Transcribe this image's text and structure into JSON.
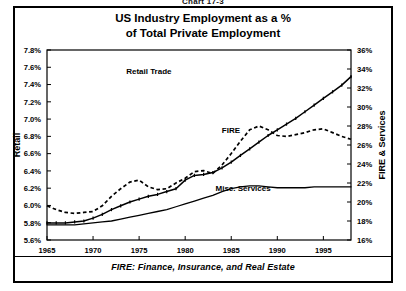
{
  "figure": {
    "number_label": "Chart 17-3",
    "title_line1": "US Industry Employment as a %",
    "title_line2": "of Total Private Employment",
    "footnote": "FIRE:  Finance, Insurance, and Real Estate"
  },
  "chart_data": {
    "type": "line",
    "title": "US Industry Employment as a % of Total Private Employment",
    "subtitle": "",
    "xlabel": "",
    "ylabel": "Retail",
    "y2label": "FIRE & Services",
    "xlim": [
      1965,
      1998
    ],
    "ylim": [
      5.6,
      7.8
    ],
    "y2lim": [
      16,
      36
    ],
    "grid": false,
    "legend": "inline-annotations",
    "xticks": [
      1965,
      1970,
      1975,
      1980,
      1985,
      1990,
      1995
    ],
    "xticklabels": [
      "1965",
      "1970",
      "1975",
      "1980",
      "1985",
      "1990",
      "1995"
    ],
    "yticks": [
      5.6,
      5.8,
      6.0,
      6.2,
      6.4,
      6.6,
      6.8,
      7.0,
      7.2,
      7.4,
      7.6,
      7.8
    ],
    "yticklabels": [
      "5.6%",
      "5.8%",
      "6.0%",
      "6.2%",
      "6.4%",
      "6.6%",
      "6.8%",
      "7.0%",
      "7.2%",
      "7.4%",
      "7.6%",
      "7.8%"
    ],
    "y2ticks": [
      16,
      18,
      20,
      22,
      24,
      26,
      28,
      30,
      32,
      34,
      36
    ],
    "y2ticklabels": [
      "16%",
      "18%",
      "20%",
      "22%",
      "24%",
      "26%",
      "28%",
      "30%",
      "32%",
      "34%",
      "36%"
    ],
    "x": [
      1965,
      1966,
      1967,
      1968,
      1969,
      1970,
      1971,
      1972,
      1973,
      1974,
      1975,
      1976,
      1977,
      1978,
      1979,
      1980,
      1981,
      1982,
      1983,
      1984,
      1985,
      1986,
      1987,
      1988,
      1989,
      1990,
      1991,
      1992,
      1993,
      1994,
      1995,
      1996,
      1997,
      1998
    ],
    "series": [
      {
        "name": "Retail Trade",
        "axis": "right",
        "style": "dashed",
        "units": "%",
        "values": [
          19.6,
          19.2,
          18.9,
          18.8,
          18.9,
          19.0,
          19.6,
          20.6,
          21.4,
          22.1,
          22.3,
          21.6,
          21.3,
          21.4,
          22.0,
          22.5,
          23.2,
          23.3,
          23.0,
          23.9,
          25.1,
          26.4,
          27.6,
          28.0,
          27.6,
          27.0,
          26.9,
          27.1,
          27.3,
          27.6,
          27.7,
          27.3,
          26.9,
          26.6
        ]
      },
      {
        "name": "FIRE",
        "axis": "right",
        "style": "solid",
        "units": "%",
        "values": [
          17.8,
          17.8,
          17.8,
          17.9,
          18.0,
          18.3,
          18.7,
          19.2,
          19.6,
          20.0,
          20.3,
          20.6,
          20.8,
          21.1,
          21.4,
          22.3,
          22.8,
          22.9,
          23.1,
          23.6,
          24.2,
          24.9,
          25.6,
          26.3,
          27.0,
          27.6,
          28.2,
          28.8,
          29.5,
          30.2,
          30.9,
          31.6,
          32.3,
          33.2
        ]
      },
      {
        "name": "Misc. Services",
        "axis": "right",
        "style": "solid",
        "units": "%",
        "values": [
          17.6,
          17.6,
          17.6,
          17.6,
          17.7,
          17.8,
          17.9,
          18.0,
          18.2,
          18.4,
          18.6,
          18.8,
          19.0,
          19.2,
          19.5,
          19.8,
          20.1,
          20.4,
          20.7,
          21.1,
          21.4,
          21.6,
          21.7,
          21.7,
          21.6,
          21.5,
          21.5,
          21.5,
          21.5,
          21.6,
          21.6,
          21.6,
          21.6,
          21.6
        ]
      }
    ],
    "annotations": [
      {
        "text": "Retail Trade",
        "x_frac": 0.335,
        "y_frac": 0.125
      },
      {
        "text": "FIRE",
        "x_frac": 0.605,
        "y_frac": 0.437
      },
      {
        "text": "Misc. Services",
        "x_frac": 0.645,
        "y_frac": 0.74
      }
    ]
  }
}
